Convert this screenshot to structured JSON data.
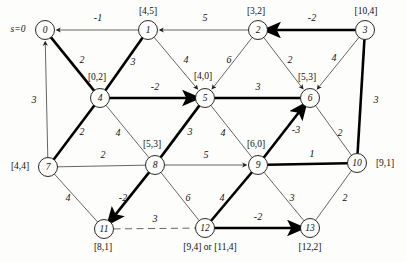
{
  "figure": {
    "source_label": "s=0",
    "colors": {
      "ink": "#111111",
      "thin": "#555555",
      "paper": "#fdfdfb"
    }
  },
  "nodes": [
    {
      "id": "0",
      "name": "node-0",
      "x": 45,
      "y": 30,
      "label": "",
      "label_x": 0,
      "label_y": 0
    },
    {
      "id": "1",
      "name": "node-1",
      "x": 148,
      "y": 30,
      "label": "[4,5]",
      "label_x": 148,
      "label_y": 12
    },
    {
      "id": "2",
      "name": "node-2",
      "x": 258,
      "y": 30,
      "label": "[3,2]",
      "label_x": 256,
      "label_y": 12
    },
    {
      "id": "3",
      "name": "node-3",
      "x": 365,
      "y": 30,
      "label": "[10,4]",
      "label_x": 366,
      "label_y": 12
    },
    {
      "id": "4",
      "name": "node-4",
      "x": 100,
      "y": 98,
      "label": "[0,2]",
      "label_x": 97,
      "label_y": 78
    },
    {
      "id": "5",
      "name": "node-5",
      "x": 205,
      "y": 98,
      "label": "[4,0]",
      "label_x": 203,
      "label_y": 77
    },
    {
      "id": "6",
      "name": "node-6",
      "x": 310,
      "y": 98,
      "label": "[5,3]",
      "label_x": 307,
      "label_y": 78
    },
    {
      "id": "7",
      "name": "node-7",
      "x": 48,
      "y": 167,
      "label": "[4,4]",
      "label_x": 20,
      "label_y": 167
    },
    {
      "id": "8",
      "name": "node-8",
      "x": 155,
      "y": 165,
      "label": "[5,3]",
      "label_x": 152,
      "label_y": 145
    },
    {
      "id": "9",
      "name": "node-9",
      "x": 258,
      "y": 165,
      "label": "[6,0]",
      "label_x": 256,
      "label_y": 145
    },
    {
      "id": "10",
      "name": "node-10",
      "x": 357,
      "y": 163,
      "label": "[9,1]",
      "label_x": 385,
      "label_y": 164
    },
    {
      "id": "11",
      "name": "node-11",
      "x": 104,
      "y": 229,
      "label": "[8,1]",
      "label_x": 103,
      "label_y": 248
    },
    {
      "id": "12",
      "name": "node-12",
      "x": 205,
      "y": 228,
      "label": "[9,4] or [11,4]",
      "label_x": 210,
      "label_y": 248
    },
    {
      "id": "13",
      "name": "node-13",
      "x": 310,
      "y": 228,
      "label": "[12,2]",
      "label_x": 310,
      "label_y": 248
    }
  ],
  "edges": [
    {
      "name": "edge-1-0",
      "from": "1",
      "to": "0",
      "weight": "-1",
      "wx": 98,
      "wy": 18,
      "bold": false,
      "dashed": false,
      "arrow": true
    },
    {
      "name": "edge-2-1",
      "from": "2",
      "to": "1",
      "weight": "5",
      "wx": 205,
      "wy": 18,
      "bold": false,
      "dashed": false,
      "arrow": true
    },
    {
      "name": "edge-3-2",
      "from": "3",
      "to": "2",
      "weight": "-2",
      "wx": 312,
      "wy": 18,
      "bold": true,
      "dashed": false,
      "arrow": true
    },
    {
      "name": "edge-0-4",
      "from": "0",
      "to": "4",
      "weight": "2",
      "wx": 82,
      "wy": 60,
      "bold": true,
      "dashed": false,
      "arrow": false
    },
    {
      "name": "edge-4-1",
      "from": "4",
      "to": "1",
      "weight": "3",
      "wx": 133,
      "wy": 62,
      "bold": true,
      "dashed": false,
      "arrow": false
    },
    {
      "name": "edge-1-5",
      "from": "1",
      "to": "5",
      "weight": "4",
      "wx": 186,
      "wy": 60,
      "bold": false,
      "dashed": false,
      "arrow": true
    },
    {
      "name": "edge-2-5",
      "from": "2",
      "to": "5",
      "weight": "6",
      "wx": 229,
      "wy": 60,
      "bold": false,
      "dashed": false,
      "arrow": true
    },
    {
      "name": "edge-2-6",
      "from": "2",
      "to": "6",
      "weight": "2",
      "wx": 290,
      "wy": 60,
      "bold": false,
      "dashed": false,
      "arrow": true
    },
    {
      "name": "edge-3-6",
      "from": "3",
      "to": "6",
      "weight": "4",
      "wx": 334,
      "wy": 58,
      "bold": false,
      "dashed": false,
      "arrow": true
    },
    {
      "name": "edge-4-5",
      "from": "4",
      "to": "5",
      "weight": "-2",
      "wx": 155,
      "wy": 87,
      "bold": true,
      "dashed": false,
      "arrow": true
    },
    {
      "name": "edge-5-6",
      "from": "5",
      "to": "6",
      "weight": "3",
      "wx": 258,
      "wy": 87,
      "bold": true,
      "dashed": false,
      "arrow": false
    },
    {
      "name": "edge-7-4",
      "from": "7",
      "to": "4",
      "weight": "2",
      "wx": 82,
      "wy": 132,
      "bold": true,
      "dashed": false,
      "arrow": false
    },
    {
      "name": "edge-4-8",
      "from": "4",
      "to": "8",
      "weight": "4",
      "wx": 118,
      "wy": 133,
      "bold": false,
      "dashed": false,
      "arrow": false
    },
    {
      "name": "edge-8-5",
      "from": "8",
      "to": "5",
      "weight": "3",
      "wx": 190,
      "wy": 132,
      "bold": true,
      "dashed": false,
      "arrow": false
    },
    {
      "name": "edge-5-9",
      "from": "5",
      "to": "9",
      "weight": "4",
      "wx": 223,
      "wy": 133,
      "bold": false,
      "dashed": false,
      "arrow": false
    },
    {
      "name": "edge-9-6",
      "from": "9",
      "to": "6",
      "weight": "-3",
      "wx": 296,
      "wy": 130,
      "bold": true,
      "dashed": false,
      "arrow": true
    },
    {
      "name": "edge-0-7",
      "from": "7",
      "to": "0",
      "weight": "3",
      "wx": 34,
      "wy": 100,
      "bold": false,
      "dashed": false,
      "arrow": true
    },
    {
      "name": "edge-6-10",
      "from": "6",
      "to": "10",
      "weight": "2",
      "wx": 340,
      "wy": 133,
      "bold": false,
      "dashed": false,
      "arrow": false
    },
    {
      "name": "edge-3-10",
      "from": "3",
      "to": "10",
      "weight": "3",
      "wx": 376,
      "wy": 100,
      "bold": true,
      "dashed": false,
      "arrow": false
    },
    {
      "name": "edge-7-8",
      "from": "7",
      "to": "8",
      "weight": "2",
      "wx": 103,
      "wy": 155,
      "bold": false,
      "dashed": false,
      "arrow": false
    },
    {
      "name": "edge-8-9",
      "from": "8",
      "to": "9",
      "weight": "5",
      "wx": 206,
      "wy": 155,
      "bold": false,
      "dashed": false,
      "arrow": true
    },
    {
      "name": "edge-9-10",
      "from": "9",
      "to": "10",
      "weight": "1",
      "wx": 312,
      "wy": 154,
      "bold": true,
      "dashed": false,
      "arrow": false
    },
    {
      "name": "edge-7-11",
      "from": "7",
      "to": "11",
      "weight": "4",
      "wx": 68,
      "wy": 198,
      "bold": false,
      "dashed": false,
      "arrow": false
    },
    {
      "name": "edge-8-11",
      "from": "8",
      "to": "11",
      "weight": "-2",
      "wx": 123,
      "wy": 198,
      "bold": true,
      "dashed": false,
      "arrow": true
    },
    {
      "name": "edge-12-8",
      "from": "12",
      "to": "8",
      "weight": "6",
      "wx": 188,
      "wy": 198,
      "bold": false,
      "dashed": false,
      "arrow": false
    },
    {
      "name": "edge-12-9",
      "from": "12",
      "to": "9",
      "weight": "4",
      "wx": 222,
      "wy": 198,
      "bold": true,
      "dashed": false,
      "arrow": false
    },
    {
      "name": "edge-9-13",
      "from": "9",
      "to": "13",
      "weight": "3",
      "wx": 292,
      "wy": 198,
      "bold": false,
      "dashed": false,
      "arrow": false
    },
    {
      "name": "edge-13-10",
      "from": "13",
      "to": "10",
      "weight": "2",
      "wx": 345,
      "wy": 198,
      "bold": false,
      "dashed": false,
      "arrow": false
    },
    {
      "name": "edge-11-12",
      "from": "11",
      "to": "12",
      "weight": "3",
      "wx": 155,
      "wy": 219,
      "bold": false,
      "dashed": true,
      "arrow": false
    },
    {
      "name": "edge-12-13",
      "from": "12",
      "to": "13",
      "weight": "-2",
      "wx": 258,
      "wy": 217,
      "bold": true,
      "dashed": false,
      "arrow": true
    }
  ],
  "graph_data": {
    "type": "network-diagram",
    "node_count": 14,
    "edge_count": 30,
    "node_label_format": "[distance, predecessor]",
    "source": "node 0",
    "notes": "Bold arcs indicate the shortest path tree; the dashed arc 11-12 is a candidate arc."
  }
}
